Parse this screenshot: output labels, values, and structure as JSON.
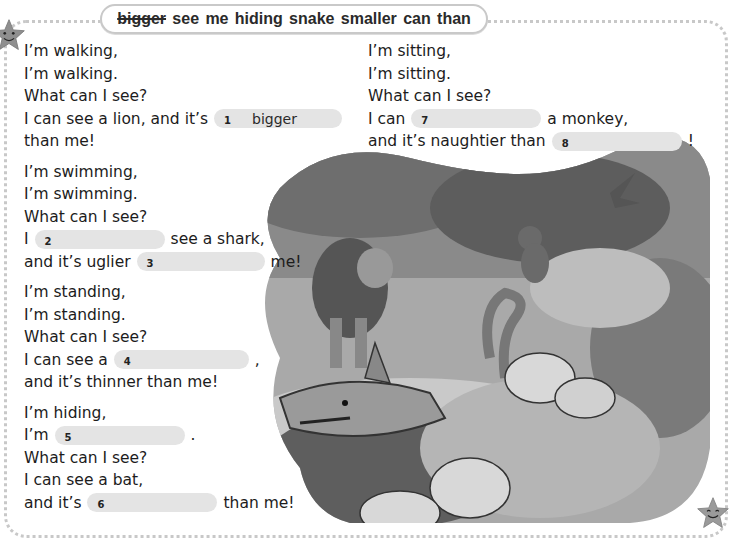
{
  "word_bank": {
    "words": [
      {
        "text": "bigger",
        "used": true
      },
      {
        "text": "see",
        "used": false
      },
      {
        "text": "me",
        "used": false
      },
      {
        "text": "hiding",
        "used": false
      },
      {
        "text": "snake",
        "used": false
      },
      {
        "text": "smaller",
        "used": false
      },
      {
        "text": "can",
        "used": false
      },
      {
        "text": "than",
        "used": false
      }
    ]
  },
  "poem": {
    "walking": {
      "l1": "I’m walking,",
      "l2": "I’m walking.",
      "l3": "What can I see?",
      "l4_pre": "I can see a lion, and it’s",
      "gap1_num": "1",
      "gap1_answer": "bigger",
      "l5": "than me!"
    },
    "swimming": {
      "l1": "I’m swimming,",
      "l2": "I’m swimming.",
      "l3": "What can I see?",
      "l4_pre": "I",
      "gap2_num": "2",
      "l4_post": "see a shark,",
      "l5_pre": "and it’s uglier",
      "gap3_num": "3",
      "l5_post": "me!"
    },
    "standing": {
      "l1": "I’m standing,",
      "l2": "I’m standing.",
      "l3": "What can I see?",
      "l4_pre": "I can see a",
      "gap4_num": "4",
      "l4_post": ",",
      "l5": "and it’s thinner than me!"
    },
    "hiding": {
      "l1": "I’m hiding,",
      "l2_pre": "I’m",
      "gap5_num": "5",
      "l2_post": ".",
      "l3": "What can I see?",
      "l4": "I can see a bat,",
      "l5_pre": "and it’s",
      "gap6_num": "6",
      "l5_post": "than me!"
    },
    "sitting": {
      "l1": "I’m sitting,",
      "l2": "I’m sitting.",
      "l3": "What can I see?",
      "l4_pre": "I can",
      "gap7_num": "7",
      "l4_post": "a monkey,",
      "l5_pre": "and it’s naughtier than",
      "gap8_num": "8",
      "l5_post": "!"
    }
  },
  "illustration": {
    "description": "Jungle scene with lion, monkey, bat, snake and shark",
    "animals": [
      "lion",
      "monkey",
      "bat",
      "snake",
      "shark"
    ]
  },
  "colors": {
    "gap_fill": "#e4e4e4",
    "border": "#c8c8c8",
    "text": "#1c1c1c"
  }
}
